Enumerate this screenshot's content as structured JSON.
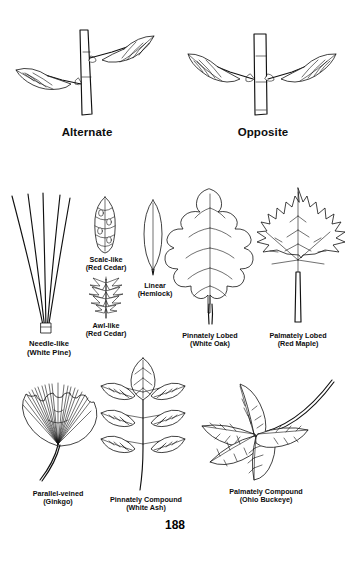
{
  "page": {
    "number": "188",
    "background_color": "#ffffff",
    "ink_color": "#111111"
  },
  "arrangement_figures": [
    {
      "id": "alternate",
      "label": "Alternate",
      "description": "twig with leaves attached at staggered, alternating nodes"
    },
    {
      "id": "opposite",
      "label": "Opposite",
      "description": "twig with leaves attached in pairs at the same node"
    }
  ],
  "leaf_figures": [
    {
      "id": "needle-like",
      "type": "Needle-like",
      "species": "(White Pine)",
      "description": "cluster of five long slender needles bound at the base"
    },
    {
      "id": "scale-like",
      "type": "Scale-like",
      "species": "(Red Cedar)",
      "description": "short flattened sprig of overlapping scale leaves"
    },
    {
      "id": "awl-like",
      "type": "Awl-like",
      "species": "(Red Cedar)",
      "description": "sprig bearing sharp pointed awl-shaped leaves"
    },
    {
      "id": "linear",
      "type": "Linear",
      "species": "(Hemlock)",
      "description": "narrow elongated blade with a single midrib"
    },
    {
      "id": "pinnately-lobed",
      "type": "Pinnately Lobed",
      "species": "(White Oak)",
      "description": "simple blade with rounded lobes ranged along a central midrib"
    },
    {
      "id": "palmately-lobed",
      "type": "Palmately Lobed",
      "species": "(Red Maple)",
      "description": "simple blade with five toothed lobes radiating from the petiole"
    },
    {
      "id": "parallel-veined",
      "type": "Parallel-veined",
      "species": "(Ginkgo)",
      "description": "fan-shaped blade with parallel veins radiating to a notched margin"
    },
    {
      "id": "pinnately-compound",
      "type": "Pinnately Compound",
      "species": "(White Ash)",
      "description": "rachis bearing three opposite pairs of leaflets plus a terminal leaflet"
    },
    {
      "id": "palmately-compound",
      "type": "Palmately Compound",
      "species": "(Ohio Buckeye)",
      "description": "five leaflets radiating from the tip of a curved petiole"
    }
  ]
}
